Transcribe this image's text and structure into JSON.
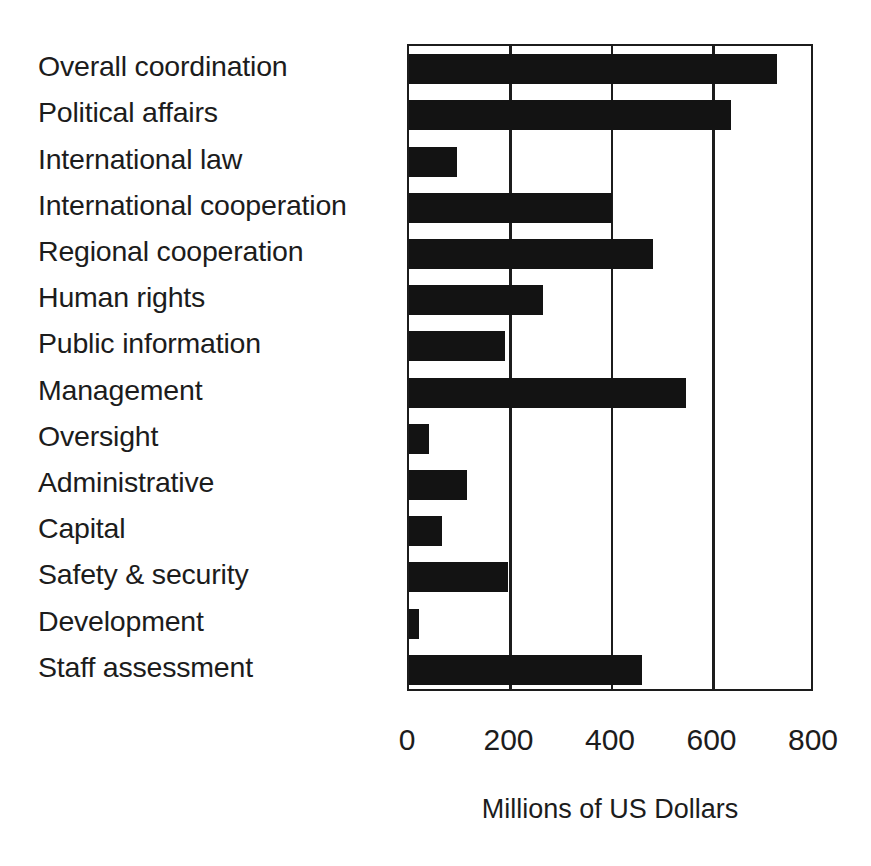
{
  "chart_data": {
    "type": "bar",
    "orientation": "horizontal",
    "title": "",
    "subtitle": "",
    "xlabel": "Millions of US Dollars",
    "ylabel": "",
    "categories": [
      "Overall coordination",
      "Political affairs",
      "International law",
      "International cooperation",
      "Regional cooperation",
      "Human rights",
      "Public information",
      "Management",
      "Oversight",
      "Administrative",
      "Capital",
      "Safety & security",
      "Development",
      "Staff assessment"
    ],
    "values": [
      725,
      635,
      95,
      400,
      480,
      265,
      190,
      545,
      40,
      115,
      65,
      195,
      20,
      460
    ],
    "xlim": [
      0,
      800
    ],
    "xticks": [
      0,
      200,
      400,
      600,
      800
    ],
    "xtick_labels": [
      "0",
      "200",
      "400",
      "600",
      "800"
    ],
    "grid": "vertical-only",
    "legend": "none",
    "bar_color": "#131313",
    "axis_color": "#1c1c1c",
    "background_color": "#ffffff"
  }
}
